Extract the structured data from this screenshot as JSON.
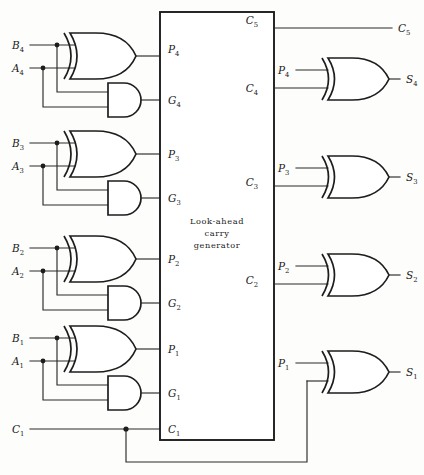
{
  "diagram": {
    "block": {
      "label_line1": "Look-ahead",
      "label_line2": "carry",
      "label_line3": "generator"
    },
    "colors": {
      "wire": "#2b2b2b",
      "gate": "#1d1d1d",
      "background": "#fdfdfb"
    },
    "inputs": [
      {
        "b": "B",
        "b_sub": "4",
        "a": "A",
        "a_sub": "4"
      },
      {
        "b": "B",
        "b_sub": "3",
        "a": "A",
        "a_sub": "3"
      },
      {
        "b": "B",
        "b_sub": "2",
        "a": "A",
        "a_sub": "2"
      },
      {
        "b": "B",
        "b_sub": "1",
        "a": "A",
        "a_sub": "1"
      }
    ],
    "carry_in": {
      "name": "C",
      "sub": "1"
    },
    "block_left_ports": [
      {
        "name": "P",
        "sub": "4"
      },
      {
        "name": "G",
        "sub": "4"
      },
      {
        "name": "P",
        "sub": "3"
      },
      {
        "name": "G",
        "sub": "3"
      },
      {
        "name": "P",
        "sub": "2"
      },
      {
        "name": "G",
        "sub": "2"
      },
      {
        "name": "P",
        "sub": "1"
      },
      {
        "name": "G",
        "sub": "1"
      },
      {
        "name": "C",
        "sub": "1"
      }
    ],
    "block_right_ports": [
      {
        "name": "C",
        "sub": "5"
      },
      {
        "name": "C",
        "sub": "4"
      },
      {
        "name": "C",
        "sub": "3"
      },
      {
        "name": "C",
        "sub": "2"
      }
    ],
    "sum_gate_p_inputs": [
      {
        "name": "P",
        "sub": "4"
      },
      {
        "name": "P",
        "sub": "3"
      },
      {
        "name": "P",
        "sub": "2"
      },
      {
        "name": "P",
        "sub": "1"
      }
    ],
    "outputs": [
      {
        "name": "C",
        "sub": "5"
      },
      {
        "name": "S",
        "sub": "4"
      },
      {
        "name": "S",
        "sub": "3"
      },
      {
        "name": "S",
        "sub": "2"
      },
      {
        "name": "S",
        "sub": "1"
      }
    ]
  }
}
